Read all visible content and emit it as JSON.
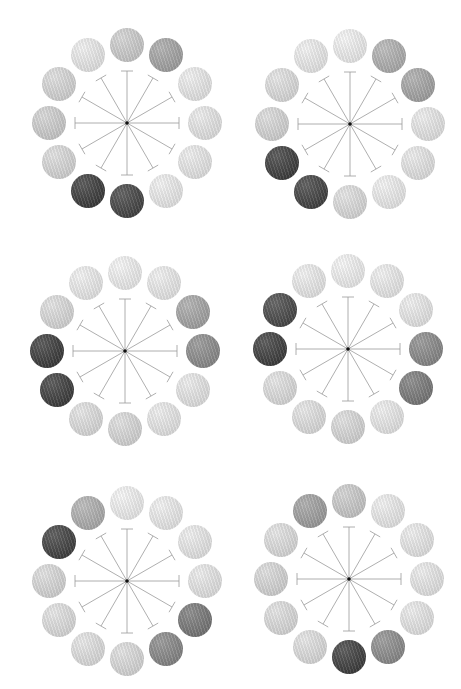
{
  "figure": {
    "ring_radius": 78,
    "ball_radius": 17,
    "spoke_length": 52
  },
  "panels": [
    {
      "id": "p1",
      "center": [
        127,
        123
      ],
      "highlight": "adjacent dark pair at 6-7 o'clock",
      "balls": [
        "#d2d2d2",
        "#a8a8a8",
        "#f0f0f0",
        "#ececec",
        "#eeeeee",
        "#f2f2f2",
        "#454545",
        "#3c3c3c",
        "#dedede",
        "#d4d4d4",
        "#dddddd",
        "#f0f0f0"
      ]
    },
    {
      "id": "p2",
      "center": [
        350,
        124
      ],
      "highlight": "dark pair at 7-8 o'clock, mid pair at 1-2 o'clock",
      "balls": [
        "#f6f6f6",
        "#b4b4b4",
        "#a9a9a9",
        "#ededed",
        "#ebebeb",
        "#f3f3f3",
        "#e2e2e2",
        "#434343",
        "#3e3e3e",
        "#dcdcdc",
        "#e4e4e4",
        "#f2f2f2"
      ]
    },
    {
      "id": "p3",
      "center": [
        125,
        351
      ],
      "highlight": "dark pair at 8-9 o'clock, mid pair at 2-3 o'clock",
      "balls": [
        "#f6f6f6",
        "#f1f1f1",
        "#a9a9a9",
        "#8f8f8f",
        "#ececec",
        "#eeeeee",
        "#dedede",
        "#e4e4e4",
        "#3e3e3e",
        "#3c3c3c",
        "#e0e0e0",
        "#f2f2f2"
      ]
    },
    {
      "id": "p4",
      "center": [
        348,
        349
      ],
      "highlight": "dark pair at 9-10 o'clock, mid pair at 3-4 o'clock",
      "balls": [
        "#f7f7f7",
        "#f1f1f1",
        "#efefef",
        "#8c8c8c",
        "#7c7c7c",
        "#efefef",
        "#dedede",
        "#e6e6e6",
        "#e4e4e4",
        "#3e3e3e",
        "#4a4a4a",
        "#f1f1f1"
      ]
    },
    {
      "id": "p5",
      "center": [
        127,
        581
      ],
      "highlight": "dark at 10, mid at 11, 4 and 5 o'clock",
      "balls": [
        "#f7f7f7",
        "#f2f2f2",
        "#efefef",
        "#ececec",
        "#7a7a7a",
        "#8a8a8a",
        "#e0e0e0",
        "#e6e6e6",
        "#e4e4e4",
        "#dedede",
        "#424242",
        "#b3b3b3"
      ]
    },
    {
      "id": "p6",
      "center": [
        349,
        579
      ],
      "highlight": "dark at 6, mid at 5 and 11, mid-light at 12 o'clock",
      "balls": [
        "#cfcfcf",
        "#f1f1f1",
        "#eeeeee",
        "#ededed",
        "#ececec",
        "#8f8f8f",
        "#3f3f3f",
        "#e4e4e4",
        "#e2e2e2",
        "#dcdcdc",
        "#e4e4e4",
        "#a3a3a3"
      ]
    }
  ],
  "colors": {
    "background": "#ffffff",
    "spoke": "#9a9a9a",
    "hub": "#111111"
  }
}
